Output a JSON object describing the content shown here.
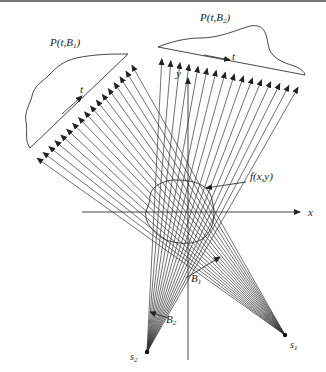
{
  "figure": {
    "labels": {
      "projection1": "P(t,B",
      "projection1_sub": "1",
      "projection2": "P(t,B",
      "projection2_sub": "2",
      "t1": "t",
      "t2": "t",
      "x_axis": "x",
      "y_axis": "y",
      "object": "f(x,y)",
      "beam1": "B",
      "beam1_sub": "1",
      "beam2": "B",
      "beam2_sub": "2",
      "source1": "s",
      "source1_sub": "1",
      "source2": "s",
      "source2_sub": "2"
    },
    "colors": {
      "line": "#333333",
      "background": "#ffffff"
    }
  }
}
